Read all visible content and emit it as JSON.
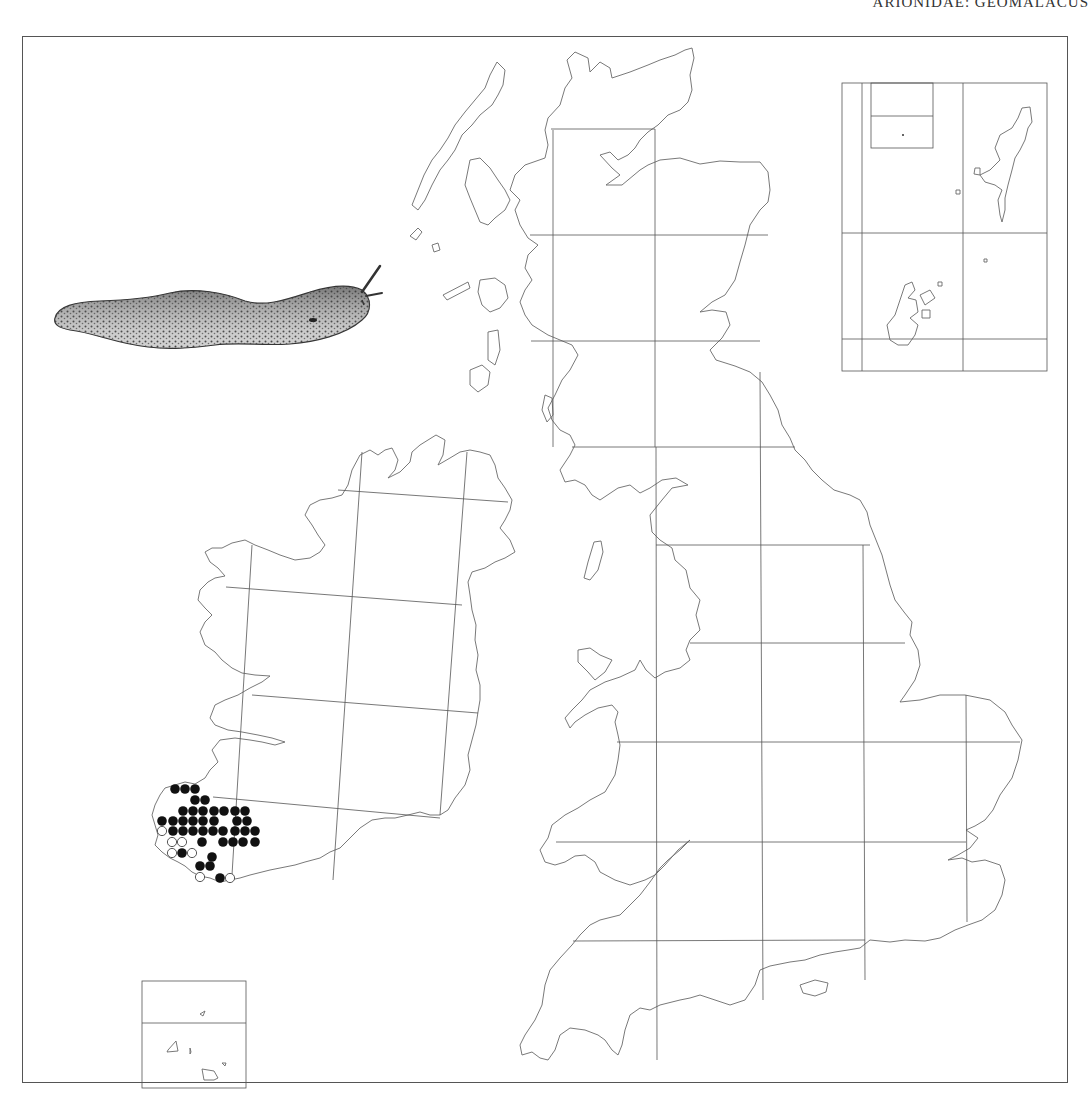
{
  "header": {
    "running_title": "ARIONIDAE: GEOMALACUS"
  },
  "map": {
    "title": "Distribution map, Britain and Ireland, 50 km grid",
    "frame": {
      "x": 22,
      "y": 36,
      "width": 1046,
      "height": 1047
    },
    "colors": {
      "coast": "#6a6a6a",
      "grid": "#555555",
      "filled_dot": "#111111",
      "open_dot_fill": "#ffffff"
    },
    "legend_symbols": [
      {
        "symbol": "filled-circle",
        "meaning": "recent record"
      },
      {
        "symbol": "open-circle",
        "meaning": "older record"
      }
    ],
    "gb_grid": {
      "verticals": [
        {
          "x1": 553,
          "y1": 130,
          "x2": 553,
          "y2": 447
        },
        {
          "x1": 655,
          "y1": 129,
          "x2": 655,
          "y2": 447
        },
        {
          "x1": 656,
          "y1": 447,
          "x2": 657,
          "y2": 1060
        },
        {
          "x1": 760,
          "y1": 447,
          "x2": 763,
          "y2": 1000
        },
        {
          "x1": 863,
          "y1": 545,
          "x2": 865,
          "y2": 980
        },
        {
          "x1": 966,
          "y1": 695,
          "x2": 967,
          "y2": 922
        },
        {
          "x1": 760,
          "y1": 372,
          "x2": 760,
          "y2": 447
        },
        {
          "x1": 551,
          "y1": 235,
          "x2": 551,
          "y2": 425
        }
      ],
      "horizontals": [
        {
          "x1": 551,
          "y1": 129,
          "x2": 655,
          "y2": 129
        },
        {
          "x1": 530,
          "y1": 235,
          "x2": 770,
          "y2": 235
        },
        {
          "x1": 531,
          "y1": 341,
          "x2": 770,
          "y2": 341
        },
        {
          "x1": 572,
          "y1": 447,
          "x2": 760,
          "y2": 447
        },
        {
          "x1": 656,
          "y1": 545,
          "x2": 863,
          "y2": 545
        },
        {
          "x1": 690,
          "y1": 643,
          "x2": 905,
          "y2": 643
        },
        {
          "x1": 617,
          "y1": 742,
          "x2": 1020,
          "y2": 742
        },
        {
          "x1": 556,
          "y1": 842,
          "x2": 966,
          "y2": 842
        },
        {
          "x1": 573,
          "y1": 941,
          "x2": 865,
          "y2": 940
        }
      ]
    },
    "ireland_grid": {
      "lines": [
        {
          "x1": 338,
          "y1": 490,
          "x2": 508,
          "y2": 502
        },
        {
          "x1": 226,
          "y1": 587,
          "x2": 462,
          "y2": 605
        },
        {
          "x1": 252,
          "y1": 695,
          "x2": 478,
          "y2": 713
        },
        {
          "x1": 213,
          "y1": 797,
          "x2": 440,
          "y2": 818
        },
        {
          "x1": 252,
          "y1": 545,
          "x2": 232,
          "y2": 875
        },
        {
          "x1": 362,
          "y1": 452,
          "x2": 333,
          "y2": 880
        },
        {
          "x1": 467,
          "y1": 452,
          "x2": 440,
          "y2": 815
        }
      ]
    },
    "records": {
      "filled": [
        [
          175,
          789
        ],
        [
          185,
          789
        ],
        [
          195,
          789
        ],
        [
          195,
          800
        ],
        [
          205,
          800
        ],
        [
          183,
          811
        ],
        [
          193,
          811
        ],
        [
          203,
          811
        ],
        [
          214,
          811
        ],
        [
          224,
          811
        ],
        [
          235,
          811
        ],
        [
          245,
          811
        ],
        [
          162,
          821
        ],
        [
          173,
          821
        ],
        [
          183,
          821
        ],
        [
          193,
          821
        ],
        [
          203,
          821
        ],
        [
          214,
          821
        ],
        [
          237,
          821
        ],
        [
          247,
          821
        ],
        [
          173,
          831
        ],
        [
          183,
          831
        ],
        [
          193,
          831
        ],
        [
          203,
          831
        ],
        [
          213,
          831
        ],
        [
          223,
          831
        ],
        [
          235,
          831
        ],
        [
          245,
          831
        ],
        [
          255,
          831
        ],
        [
          202,
          842
        ],
        [
          223,
          842
        ],
        [
          233,
          842
        ],
        [
          243,
          842
        ],
        [
          255,
          842
        ],
        [
          182,
          853
        ],
        [
          212,
          857
        ],
        [
          200,
          866
        ],
        [
          210,
          866
        ],
        [
          220,
          878
        ]
      ],
      "open": [
        [
          162,
          831
        ],
        [
          172,
          842
        ],
        [
          182,
          842
        ],
        [
          172,
          853
        ],
        [
          192,
          853
        ],
        [
          200,
          877
        ],
        [
          230,
          878
        ]
      ]
    },
    "inset_northern_isles": {
      "box": {
        "x": 842,
        "y": 83,
        "width": 205,
        "height": 288
      },
      "verticals": [
        862,
        963
      ],
      "horizontals": [
        233,
        339
      ],
      "sub_box": {
        "x": 871,
        "y": 83,
        "width": 62,
        "height": 65,
        "divider_y": 116
      },
      "labels": [
        "Shetland",
        "Orkney",
        "Fair Isle",
        "Foula",
        "St Kilda"
      ]
    },
    "inset_channel_islands": {
      "box": {
        "x": 142,
        "y": 981,
        "width": 104,
        "height": 107
      },
      "divider_y": 1023,
      "labels": [
        "Alderney",
        "Guernsey",
        "Sark",
        "Jersey"
      ]
    },
    "illustration": {
      "subject": "slug (Geomalacus maculosus), side view",
      "x": 52,
      "y": 265,
      "width": 330,
      "height": 85
    }
  }
}
